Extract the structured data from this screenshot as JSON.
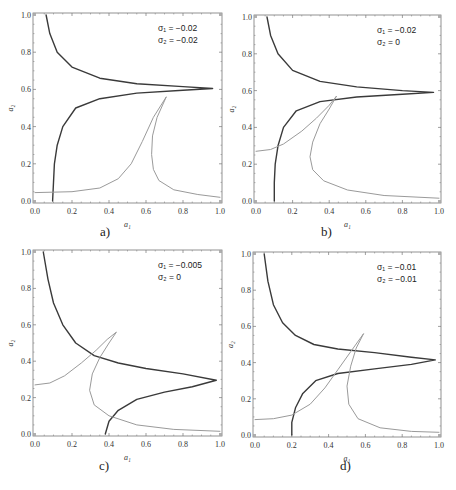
{
  "figure": {
    "panels": [
      {
        "id": "a",
        "caption": "a)",
        "annotation_line1": "σ₁ = −0.02",
        "annotation_line2": "σ₂ = −0.02"
      },
      {
        "id": "b",
        "caption": "b)",
        "annotation_line1": "σ₁ = −0.02",
        "annotation_line2": "σ₂ = 0"
      },
      {
        "id": "c",
        "caption": "c)",
        "annotation_line1": "σ₁ = −0.005",
        "annotation_line2": "σ₂ = 0"
      },
      {
        "id": "d",
        "caption": "d)",
        "annotation_line1": "σ₁ = −0.01",
        "annotation_line2": "σ₂ = −0.01"
      }
    ]
  },
  "colors": {
    "dark_curve": "#3a3a3a",
    "light_curve": "#9a9a9a",
    "frame": "#777777",
    "text": "#333333"
  },
  "chart_data": [
    {
      "type": "line",
      "title": "a)",
      "xlabel": "a₁",
      "ylabel": "a₂",
      "xlim": [
        0,
        1
      ],
      "ylim": [
        0,
        1
      ],
      "xticks": [
        "0.0",
        "0.2",
        "0.4",
        "0.6",
        "0.8",
        "1.0"
      ],
      "yticks": [
        "0.0",
        "0.2",
        "0.4",
        "0.6",
        "0.8",
        "1.0"
      ],
      "annotation": [
        "σ₁ = −0.02",
        "σ₂ = −0.02"
      ],
      "series": [
        {
          "name": "dark",
          "color": "#3a3a3a",
          "points": [
            [
              0.06,
              1.0
            ],
            [
              0.08,
              0.9
            ],
            [
              0.12,
              0.8
            ],
            [
              0.2,
              0.72
            ],
            [
              0.35,
              0.66
            ],
            [
              0.55,
              0.63
            ],
            [
              0.8,
              0.615
            ],
            [
              0.96,
              0.605
            ],
            [
              0.8,
              0.595
            ],
            [
              0.55,
              0.58
            ],
            [
              0.35,
              0.55
            ],
            [
              0.22,
              0.5
            ],
            [
              0.15,
              0.4
            ],
            [
              0.12,
              0.3
            ],
            [
              0.105,
              0.2
            ],
            [
              0.1,
              0.1
            ],
            [
              0.095,
              0.0
            ]
          ]
        },
        {
          "name": "light",
          "color": "#9a9a9a",
          "points": [
            [
              0.0,
              0.045
            ],
            [
              0.2,
              0.05
            ],
            [
              0.35,
              0.07
            ],
            [
              0.45,
              0.12
            ],
            [
              0.52,
              0.2
            ],
            [
              0.58,
              0.32
            ],
            [
              0.64,
              0.45
            ],
            [
              0.71,
              0.56
            ],
            [
              0.66,
              0.45
            ],
            [
              0.635,
              0.35
            ],
            [
              0.63,
              0.25
            ],
            [
              0.64,
              0.17
            ],
            [
              0.67,
              0.11
            ],
            [
              0.75,
              0.06
            ],
            [
              0.88,
              0.035
            ],
            [
              1.0,
              0.02
            ]
          ]
        }
      ]
    },
    {
      "type": "line",
      "title": "b)",
      "xlabel": "a₁",
      "ylabel": "a₂",
      "xlim": [
        0,
        1
      ],
      "ylim": [
        0,
        1
      ],
      "xticks": [
        "0.0",
        "0.2",
        "0.4",
        "0.6",
        "0.8",
        "1.0"
      ],
      "yticks": [
        "0.0",
        "0.2",
        "0.4",
        "0.6",
        "0.8",
        "1.0"
      ],
      "annotation": [
        "σ₁ = −0.02",
        "σ₂ = 0"
      ],
      "series": [
        {
          "name": "dark",
          "color": "#3a3a3a",
          "points": [
            [
              0.06,
              1.0
            ],
            [
              0.08,
              0.9
            ],
            [
              0.12,
              0.8
            ],
            [
              0.2,
              0.71
            ],
            [
              0.35,
              0.65
            ],
            [
              0.55,
              0.62
            ],
            [
              0.8,
              0.6
            ],
            [
              0.97,
              0.59
            ],
            [
              0.8,
              0.58
            ],
            [
              0.55,
              0.565
            ],
            [
              0.35,
              0.54
            ],
            [
              0.22,
              0.49
            ],
            [
              0.15,
              0.4
            ],
            [
              0.12,
              0.3
            ],
            [
              0.105,
              0.2
            ],
            [
              0.1,
              0.1
            ],
            [
              0.1,
              0.0
            ]
          ]
        },
        {
          "name": "light",
          "color": "#9a9a9a",
          "points": [
            [
              0.0,
              0.27
            ],
            [
              0.08,
              0.28
            ],
            [
              0.15,
              0.31
            ],
            [
              0.25,
              0.38
            ],
            [
              0.33,
              0.45
            ],
            [
              0.4,
              0.52
            ],
            [
              0.44,
              0.57
            ],
            [
              0.4,
              0.5
            ],
            [
              0.35,
              0.42
            ],
            [
              0.31,
              0.32
            ],
            [
              0.295,
              0.24
            ],
            [
              0.31,
              0.17
            ],
            [
              0.37,
              0.11
            ],
            [
              0.5,
              0.06
            ],
            [
              0.7,
              0.03
            ],
            [
              1.0,
              0.015
            ]
          ]
        }
      ]
    },
    {
      "type": "line",
      "title": "c)",
      "xlabel": "a₁",
      "ylabel": "a₂",
      "xlim": [
        0,
        1
      ],
      "ylim": [
        0,
        1
      ],
      "xticks": [
        "0.0",
        "0.2",
        "0.4",
        "0.6",
        "0.8",
        "1.0"
      ],
      "yticks": [
        "0.0",
        "0.2",
        "0.4",
        "0.6",
        "0.8",
        "1.0"
      ],
      "annotation": [
        "σ₁ = −0.005",
        "σ₂ = 0"
      ],
      "series": [
        {
          "name": "dark",
          "color": "#3a3a3a",
          "points": [
            [
              0.045,
              1.0
            ],
            [
              0.07,
              0.85
            ],
            [
              0.1,
              0.72
            ],
            [
              0.15,
              0.6
            ],
            [
              0.22,
              0.5
            ],
            [
              0.32,
              0.43
            ],
            [
              0.45,
              0.39
            ],
            [
              0.6,
              0.36
            ],
            [
              0.8,
              0.33
            ],
            [
              0.98,
              0.295
            ],
            [
              0.85,
              0.26
            ],
            [
              0.7,
              0.23
            ],
            [
              0.55,
              0.19
            ],
            [
              0.45,
              0.13
            ],
            [
              0.4,
              0.07
            ],
            [
              0.38,
              0.0
            ]
          ]
        },
        {
          "name": "light",
          "color": "#9a9a9a",
          "points": [
            [
              0.0,
              0.27
            ],
            [
              0.08,
              0.28
            ],
            [
              0.16,
              0.32
            ],
            [
              0.25,
              0.39
            ],
            [
              0.33,
              0.46
            ],
            [
              0.39,
              0.52
            ],
            [
              0.44,
              0.56
            ],
            [
              0.4,
              0.5
            ],
            [
              0.35,
              0.42
            ],
            [
              0.31,
              0.33
            ],
            [
              0.295,
              0.24
            ],
            [
              0.32,
              0.16
            ],
            [
              0.4,
              0.1
            ],
            [
              0.55,
              0.05
            ],
            [
              0.75,
              0.025
            ],
            [
              1.0,
              0.015
            ]
          ]
        }
      ]
    },
    {
      "type": "line",
      "title": "d)",
      "xlabel": "a₁",
      "ylabel": "a₂",
      "xlim": [
        0,
        1
      ],
      "ylim": [
        0,
        1
      ],
      "xticks": [
        "0.0",
        "0.2",
        "0.4",
        "0.6",
        "0.8",
        "1.0"
      ],
      "yticks": [
        "0.0",
        "0.2",
        "0.4",
        "0.6",
        "0.8",
        "1.0"
      ],
      "annotation": [
        "σ₁ = −0.01",
        "σ₂ = −0.01"
      ],
      "series": [
        {
          "name": "dark",
          "color": "#3a3a3a",
          "points": [
            [
              0.05,
              1.0
            ],
            [
              0.07,
              0.85
            ],
            [
              0.1,
              0.72
            ],
            [
              0.15,
              0.62
            ],
            [
              0.22,
              0.55
            ],
            [
              0.32,
              0.5
            ],
            [
              0.45,
              0.475
            ],
            [
              0.65,
              0.455
            ],
            [
              0.85,
              0.43
            ],
            [
              0.98,
              0.415
            ],
            [
              0.85,
              0.39
            ],
            [
              0.65,
              0.365
            ],
            [
              0.45,
              0.34
            ],
            [
              0.33,
              0.3
            ],
            [
              0.26,
              0.23
            ],
            [
              0.22,
              0.15
            ],
            [
              0.2,
              0.07
            ],
            [
              0.2,
              0.0
            ]
          ]
        },
        {
          "name": "light",
          "color": "#9a9a9a",
          "points": [
            [
              0.0,
              0.085
            ],
            [
              0.1,
              0.09
            ],
            [
              0.2,
              0.11
            ],
            [
              0.3,
              0.17
            ],
            [
              0.38,
              0.26
            ],
            [
              0.45,
              0.36
            ],
            [
              0.52,
              0.46
            ],
            [
              0.59,
              0.56
            ],
            [
              0.55,
              0.48
            ],
            [
              0.52,
              0.38
            ],
            [
              0.5,
              0.27
            ],
            [
              0.51,
              0.17
            ],
            [
              0.56,
              0.09
            ],
            [
              0.68,
              0.04
            ],
            [
              0.85,
              0.02
            ],
            [
              1.0,
              0.015
            ]
          ]
        }
      ]
    }
  ]
}
